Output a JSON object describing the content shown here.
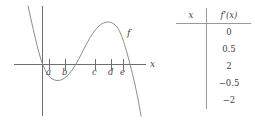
{
  "graph": {
    "curve_label": "f",
    "x_axis_label": "x",
    "tick_labels": [
      "a",
      "b",
      "c",
      "d",
      "e"
    ],
    "curve_color": "#8c8c8c",
    "axis_color": "#6e6e6e",
    "label_color": "#4a4a4a",
    "description": "Graph of f: steep decreasing branch from upper left crossing the x-axis at the y-axis, a local minimum between a and b, an x-intercept between b and c, a local maximum above d, and a steep decreasing branch crossing the x-axis just right of e"
  },
  "table": {
    "headers": [
      "x",
      "f'(x)"
    ],
    "x_values": [
      "",
      "",
      "",
      "",
      ""
    ],
    "fprime_values": [
      "0",
      "0.5",
      "2",
      "−0.5",
      "−2"
    ],
    "rule_color": "#9a9a9a",
    "text_color": "#3f3f3f"
  }
}
